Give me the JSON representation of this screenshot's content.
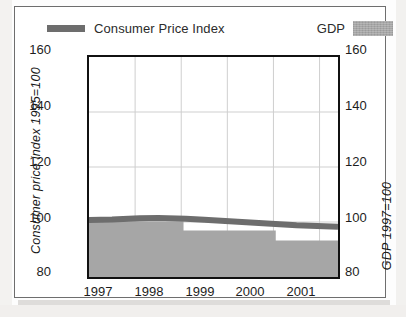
{
  "legend": {
    "cpi_label": "Consumer Price Index",
    "gdp_label": "GDP",
    "cpi_swatch_icon": "line-swatch-icon",
    "gdp_swatch_icon": "area-swatch-icon"
  },
  "axes": {
    "left_title": "Consumer price index 1995=100",
    "right_title": "GDP 1997=100",
    "y_ticks": [
      "160",
      "140",
      "120",
      "100",
      "80"
    ],
    "x_ticks": [
      "1997",
      "1998",
      "1999",
      "2000",
      "2001"
    ]
  },
  "colors": {
    "cpi_line": "#6d6d6d",
    "gdp_fill": "#a6a6a6",
    "frame": "#111111",
    "grid": "#cfcfcf",
    "outer_border": "#6e6e6e",
    "text": "#1d1d1d"
  },
  "chart_data": {
    "type": "area",
    "title": "",
    "subtitle": "",
    "xlabel": "",
    "ylabel": "Consumer price index 1995=100",
    "ylabel_secondary": "GDP 1997=100",
    "xlim": [
      1996.5,
      2001.9
    ],
    "ylim": [
      80,
      160
    ],
    "ytick_values": [
      80,
      100,
      120,
      140,
      160
    ],
    "xtick_values": [
      1997,
      1998,
      1999,
      2000,
      2001
    ],
    "grid": true,
    "legend_position": "top",
    "series": [
      {
        "name": "Consumer Price Index",
        "type": "line",
        "color": "#6d6d6d",
        "axis": "left",
        "x": [
          1996.5,
          1997.0,
          1997.6,
          1998.0,
          1998.6,
          1999.0,
          2000.0,
          2001.0,
          2001.9
        ],
        "values": [
          100.7,
          100.9,
          101.4,
          101.5,
          101.2,
          100.8,
          99.8,
          98.8,
          98.3
        ]
      },
      {
        "name": "GDP",
        "type": "step-area",
        "color": "#a6a6a6",
        "axis": "right",
        "steps": [
          {
            "x_start": 1996.5,
            "x_end": 1998.55,
            "value": 100.3
          },
          {
            "x_start": 1998.55,
            "x_end": 2000.55,
            "value": 96.9
          },
          {
            "x_start": 2000.55,
            "x_end": 2001.9,
            "value": 93.3
          }
        ],
        "baseline": 80
      }
    ]
  }
}
